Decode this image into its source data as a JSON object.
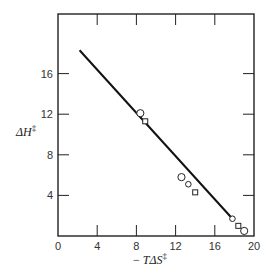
{
  "chart_data": {
    "type": "scatter",
    "title": "",
    "xlabel": "− TΔS‡",
    "ylabel": "ΔH‡",
    "xlim": [
      0,
      20
    ],
    "ylim": [
      0,
      20
    ],
    "x_ticks": [
      0,
      4,
      8,
      12,
      16,
      20
    ],
    "y_ticks": [
      4,
      8,
      12,
      16
    ],
    "grid": false,
    "legend": null,
    "series": [
      {
        "name": "circles",
        "marker": "circle",
        "points": [
          [
            8.4,
            12.1
          ],
          [
            12.6,
            5.8
          ],
          [
            13.3,
            5.1
          ],
          [
            17.8,
            1.7
          ],
          [
            19.0,
            0.5
          ]
        ]
      },
      {
        "name": "squares",
        "marker": "square",
        "points": [
          [
            8.9,
            11.3
          ],
          [
            14.0,
            4.3
          ],
          [
            18.4,
            1.0
          ]
        ]
      },
      {
        "name": "fit line",
        "type": "line",
        "points": [
          [
            2.2,
            18.3
          ],
          [
            17.8,
            1.7
          ]
        ]
      }
    ]
  },
  "axes": {
    "x_label_prefix": "− ",
    "x_label_main": "TΔS",
    "x_label_sup": "‡",
    "y_label_main": "ΔH",
    "y_label_sup": "‡"
  }
}
